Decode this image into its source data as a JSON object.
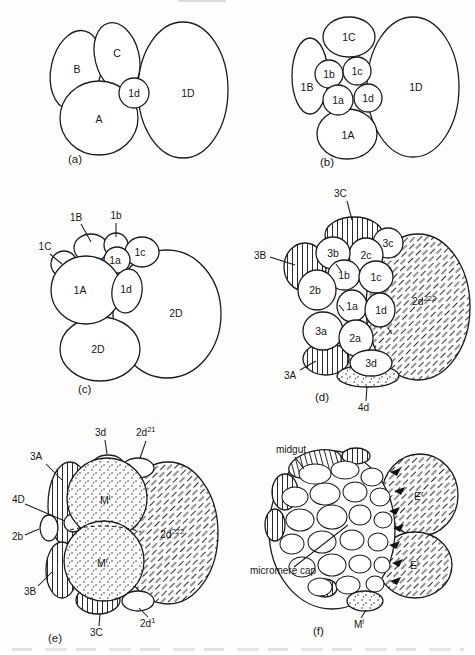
{
  "page": {
    "background": "#fdfdfc",
    "ink": "#1c1c1c"
  },
  "panels": {
    "a": {
      "tag": "(a)",
      "labels": {
        "A": "A",
        "B": "B",
        "C": "C",
        "1d": "1d",
        "1D": "1D"
      }
    },
    "b": {
      "tag": "(b)",
      "labels": {
        "1A": "1A",
        "1B": "1B",
        "1C": "1C",
        "1D": "1D",
        "1a": "1a",
        "1b": "1b",
        "1c": "1c",
        "1d": "1d"
      }
    },
    "c": {
      "tag": "(c)",
      "labels": {
        "1A": "1A",
        "1B": "1B",
        "1C": "1C",
        "1a": "1a",
        "1b": "1b",
        "1c": "1c",
        "1d": "1d",
        "2D_right": "2D",
        "2D_lower": "2D"
      }
    },
    "d": {
      "tag": "(d)",
      "labels": {
        "3A": "3A",
        "3B": "3B",
        "3C": "3C",
        "4d": "4d",
        "1a": "1a",
        "1b": "1b",
        "1c": "1c",
        "1d": "1d",
        "2a": "2a",
        "2b": "2b",
        "2c": "2c",
        "3a": "3a",
        "3b": "3b",
        "3c": "3c",
        "3d": "3d"
      },
      "sup": {
        "2d222": {
          "t": "2d",
          "sup": "222"
        }
      }
    },
    "e": {
      "tag": "(e)",
      "labels": {
        "3d": "3d",
        "3A": "3A",
        "4D": "4D",
        "2b": "2b",
        "3B": "3B",
        "3C": "3C"
      },
      "sup": {
        "2d21": {
          "t": "2d",
          "sup": "21"
        },
        "2d222": {
          "t": "2d",
          "sup": "222"
        },
        "2d1": {
          "t": "2d",
          "sup": "1"
        },
        "Ml": {
          "t": "M",
          "sup": "l"
        },
        "Mr": {
          "t": "M",
          "sup": "r"
        }
      }
    },
    "f": {
      "tag": "(f)",
      "labels": {
        "midgut": "midgut",
        "micromere_cap": "micromere cap"
      },
      "sup": {
        "Er": {
          "t": "E",
          "sup": "r"
        },
        "El": {
          "t": "E",
          "sup": "l"
        },
        "Ml": {
          "t": "M",
          "sup": "l"
        }
      }
    }
  }
}
